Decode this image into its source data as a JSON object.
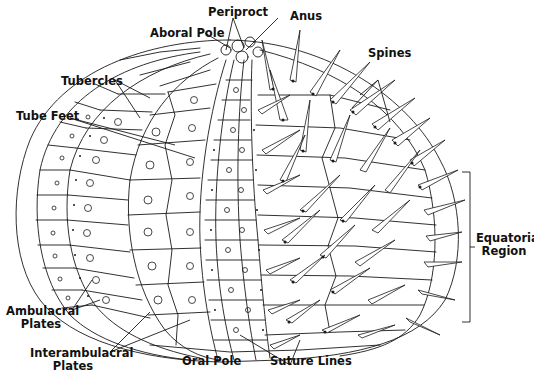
{
  "diagram": {
    "colors": {
      "line": "#1a1a1a",
      "background": "#ffffff"
    },
    "labels": {
      "periproct": "Periproct",
      "anus": "Anus",
      "aboral_pole": "Aboral Pole",
      "spines": "Spines",
      "tubercles": "Tubercles",
      "tube_feet": "Tube Feet",
      "equatorial_region_line1": "Equatorial",
      "equatorial_region_line2": "Region",
      "ambulacral_plates_line1": "Ambulacral",
      "ambulacral_plates_line2": "Plates",
      "interambulacral_plates_line1": "Interambulacral",
      "interambulacral_plates_line2": "Plates",
      "oral_pole": "Oral Pole",
      "suture_lines": "Suture Lines"
    }
  }
}
